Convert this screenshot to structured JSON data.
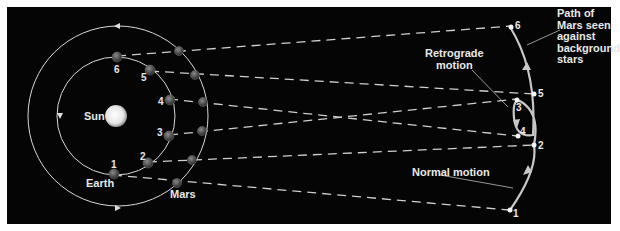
{
  "colors": {
    "background": "#050505",
    "orbit": "#d8d8d8",
    "text": "#e8e8e8",
    "dash": "#cfcfcf"
  },
  "labels": {
    "sun": "Sun",
    "earth": "Earth",
    "mars": "Mars",
    "retrograde": "Retrograde\nmotion",
    "normal": "Normal motion",
    "path_note": "Path of\nMars seen\nagainst\nbackground\nstars"
  },
  "earth_positions": [
    {
      "n": "1"
    },
    {
      "n": "2"
    },
    {
      "n": "3"
    },
    {
      "n": "4"
    },
    {
      "n": "5"
    },
    {
      "n": "6"
    }
  ],
  "sky_positions": [
    {
      "n": "1"
    },
    {
      "n": "2"
    },
    {
      "n": "3"
    },
    {
      "n": "4"
    },
    {
      "n": "5"
    },
    {
      "n": "6"
    }
  ]
}
